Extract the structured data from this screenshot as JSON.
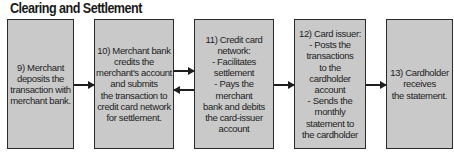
{
  "title": "Clearing and Settlement",
  "colors": {
    "box_fill": "#c9c9c9",
    "box_border": "#2b2b2b",
    "text": "#1e1e1e",
    "background": "#ffffff"
  },
  "steps": [
    {
      "id": 9,
      "text": "9) Merchant\ndeposits the\ntransaction with\nmerchant bank."
    },
    {
      "id": 10,
      "text": "10) Merchant bank\ncredits the\nmerchant's account\nand submits\nthe transaction to\ncredit card network\nfor settlement."
    },
    {
      "id": 11,
      "text": "11) Credit card\nnetwork:\n- Facilitates\nsettlement\n- Pays the merchant\nbank and debits\nthe card-issuer\naccount"
    },
    {
      "id": 12,
      "text": "12) Card issuer:\n- Posts the\ntransactions\nto the\ncardholder\naccount\n- Sends the\nmonthly\nstatement to\nthe cardholder"
    },
    {
      "id": 13,
      "text": "13) Cardholder\nreceives\nthe statement."
    }
  ],
  "arrows": [
    {
      "from": 9,
      "to": 10,
      "direction": "right"
    },
    {
      "from": 10,
      "to": 11,
      "direction": "right"
    },
    {
      "from": 11,
      "to": 10,
      "direction": "left"
    },
    {
      "from": 11,
      "to": 12,
      "direction": "right"
    },
    {
      "from": 12,
      "to": 13,
      "direction": "right"
    }
  ]
}
